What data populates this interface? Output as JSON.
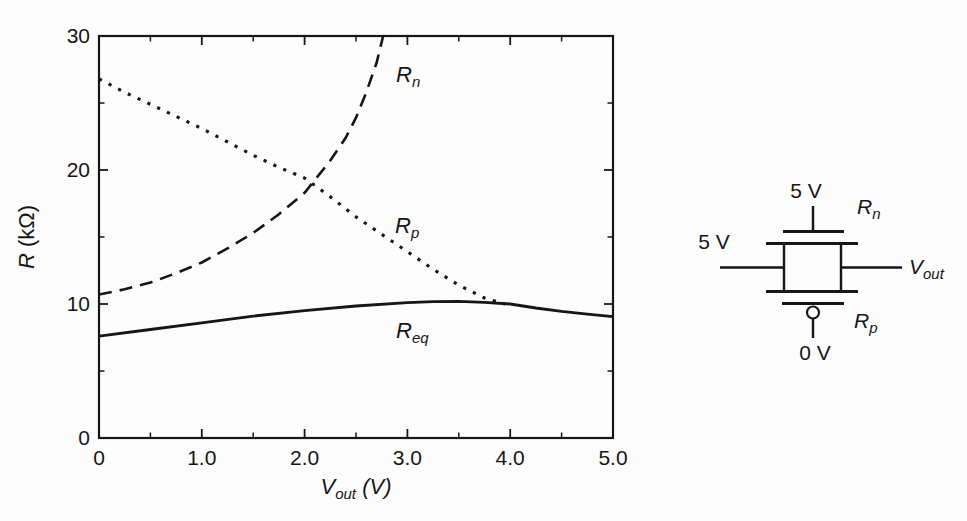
{
  "figure": {
    "background": "#fcfcfc",
    "ink_color": "#161616"
  },
  "chart_data": {
    "type": "line",
    "title": "",
    "xlabel": {
      "main": "V",
      "sub": "out",
      "unit": " (V)"
    },
    "ylabel": {
      "main": "R",
      "unit": " (kΩ)"
    },
    "xlim": [
      0,
      5
    ],
    "ylim": [
      0,
      30
    ],
    "grid": false,
    "frame": "box",
    "x_ticks": [
      {
        "v": 0,
        "label": "0"
      },
      {
        "v": 1,
        "label": "1.0"
      },
      {
        "v": 2,
        "label": "2.0"
      },
      {
        "v": 3,
        "label": "3.0"
      },
      {
        "v": 4,
        "label": "4.0"
      },
      {
        "v": 5,
        "label": "5.0"
      }
    ],
    "x_minor_ticks": [
      0.5,
      1.5,
      2.5,
      3.5,
      4.5
    ],
    "y_ticks": [
      {
        "v": 0,
        "label": "0"
      },
      {
        "v": 10,
        "label": "10"
      },
      {
        "v": 20,
        "label": "20"
      },
      {
        "v": 30,
        "label": "30"
      }
    ],
    "y_minor_ticks": [
      5,
      15,
      25
    ],
    "series": [
      {
        "name": "Rn",
        "label": {
          "main": "R",
          "sub": "n"
        },
        "label_pos": {
          "v": 2.89,
          "r": 26.6
        },
        "style": "dashed",
        "points": [
          [
            0,
            10.7
          ],
          [
            0.25,
            11.1
          ],
          [
            0.5,
            11.6
          ],
          [
            0.75,
            12.3
          ],
          [
            1,
            13.1
          ],
          [
            1.25,
            14.15
          ],
          [
            1.5,
            15.3
          ],
          [
            1.75,
            16.7
          ],
          [
            2,
            18.3
          ],
          [
            2.25,
            20.7
          ],
          [
            2.4,
            22.4
          ],
          [
            2.5,
            23.9
          ],
          [
            2.6,
            25.8
          ],
          [
            2.7,
            28.0
          ],
          [
            2.78,
            30.5
          ]
        ]
      },
      {
        "name": "Rp",
        "label": {
          "main": "R",
          "sub": "p"
        },
        "label_pos": {
          "v": 2.88,
          "r": 15.3
        },
        "style": "dotted",
        "points": [
          [
            0,
            26.8
          ],
          [
            0.25,
            25.8
          ],
          [
            0.5,
            24.9
          ],
          [
            0.75,
            24.0
          ],
          [
            1,
            23.1
          ],
          [
            1.25,
            22.1
          ],
          [
            1.5,
            21.1
          ],
          [
            1.75,
            20.2
          ],
          [
            2,
            19.4
          ],
          [
            2.25,
            18.0
          ],
          [
            2.5,
            16.5
          ],
          [
            2.75,
            15.2
          ],
          [
            3,
            13.9
          ],
          [
            3.25,
            12.6
          ],
          [
            3.5,
            11.4
          ],
          [
            3.75,
            10.45
          ],
          [
            3.95,
            10.0
          ]
        ]
      },
      {
        "name": "Req",
        "label": {
          "main": "R",
          "sub": "eq"
        },
        "label_pos": {
          "v": 2.89,
          "r": 7.5
        },
        "style": "solid",
        "points": [
          [
            0,
            7.6
          ],
          [
            0.5,
            8.1
          ],
          [
            1,
            8.6
          ],
          [
            1.5,
            9.1
          ],
          [
            2,
            9.5
          ],
          [
            2.5,
            9.85
          ],
          [
            3,
            10.1
          ],
          [
            3.25,
            10.18
          ],
          [
            3.5,
            10.2
          ],
          [
            3.75,
            10.12
          ],
          [
            4,
            10.0
          ],
          [
            4.25,
            9.7
          ],
          [
            4.5,
            9.45
          ],
          [
            4.75,
            9.25
          ],
          [
            5,
            9.05
          ]
        ]
      }
    ]
  },
  "circuit": {
    "labels": {
      "gate_top_voltage": "5 V",
      "input_voltage": "5 V",
      "gate_bottom_voltage": "0 V",
      "nmos_label": {
        "main": "R",
        "sub": "n"
      },
      "pmos_label": {
        "main": "R",
        "sub": "p"
      },
      "output_label": {
        "main": "V",
        "sub": "out"
      }
    }
  }
}
